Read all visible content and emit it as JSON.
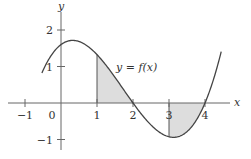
{
  "figure": {
    "type": "function-graph",
    "curve_label": "y = f(x)",
    "x_axis_label": "x",
    "y_axis_label": "y",
    "x_ticks": [
      {
        "value": -1,
        "label": "−1"
      },
      {
        "value": 0,
        "label": "0"
      },
      {
        "value": 1,
        "label": "1"
      },
      {
        "value": 2,
        "label": "2"
      },
      {
        "value": 3,
        "label": "3"
      },
      {
        "value": 4,
        "label": "4"
      }
    ],
    "y_ticks": [
      {
        "value": 2,
        "label": "2"
      },
      {
        "value": 1,
        "label": "1"
      },
      {
        "value": -1,
        "label": "−1"
      }
    ],
    "shaded_regions": [
      {
        "from": 1,
        "to": 2,
        "sign": "positive"
      },
      {
        "from": 3,
        "to": 4,
        "sign": "negative"
      }
    ],
    "colors": {
      "curve": "#444444",
      "axes": "#666666",
      "shade": "#dddddd"
    }
  }
}
